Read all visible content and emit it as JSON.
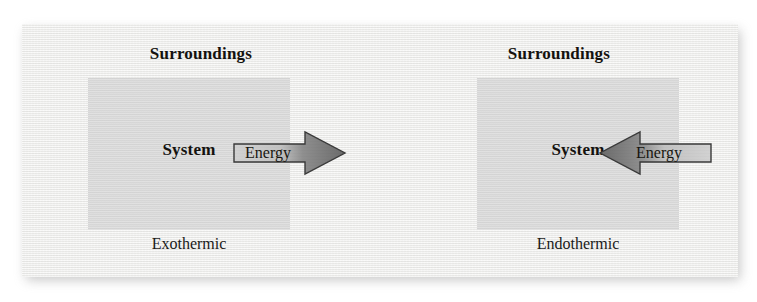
{
  "figure": {
    "background_color": "#ffffff",
    "panel_color": "#f2f2f0",
    "system_box_color": "#d9d9d9",
    "arrow_light_color": "#c9c9c9",
    "arrow_dark_color": "#6e6e6e",
    "text_color": "#14120f"
  },
  "panels": [
    {
      "surroundings_label": "Surroundings",
      "system_label": "System",
      "process_label": "Exothermic",
      "arrow": {
        "energy_label": "Energy",
        "direction": "right",
        "meaning": "energy flows from system to surroundings"
      }
    },
    {
      "surroundings_label": "Surroundings",
      "system_label": "System",
      "process_label": "Endothermic",
      "arrow": {
        "energy_label": "Energy",
        "direction": "left",
        "meaning": "energy flows from surroundings to system"
      }
    }
  ]
}
